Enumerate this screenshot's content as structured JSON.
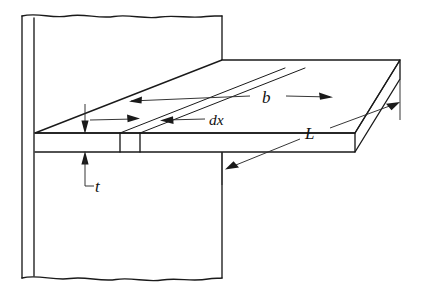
{
  "figure": {
    "background_color": "#ffffff",
    "line_color": "#1a1a1a",
    "width": 426,
    "height": 291
  },
  "labels": {
    "breadth": "b",
    "length": "L",
    "thickness": "t",
    "element": "dx"
  },
  "dimensions": [
    {
      "id": "breadth",
      "symbol": "b",
      "description": "width of beam measured across the top face toward the wall",
      "arrow_style": "double-headed",
      "orientation": "oblique-receding"
    },
    {
      "id": "length",
      "symbol": "L",
      "description": "span of beam projecting out from the wall",
      "arrow_style": "double-headed",
      "orientation": "oblique-depth"
    },
    {
      "id": "thickness",
      "symbol": "t",
      "description": "thickness of the beam at the wall face",
      "arrow_style": "double-headed",
      "orientation": "vertical"
    },
    {
      "id": "element",
      "symbol": "dx",
      "description": "infinitesimal slice of the beam",
      "arrow_style": "double-headed",
      "orientation": "oblique-receding"
    }
  ],
  "components": [
    {
      "id": "wall",
      "name": "wall",
      "edges": "broken (wavy) top and bottom"
    },
    {
      "id": "beam",
      "name": "cantilever-beam",
      "faces": [
        "top",
        "front",
        "end"
      ]
    },
    {
      "id": "slice",
      "name": "dx-slice",
      "description": "narrow strip across beam"
    }
  ]
}
